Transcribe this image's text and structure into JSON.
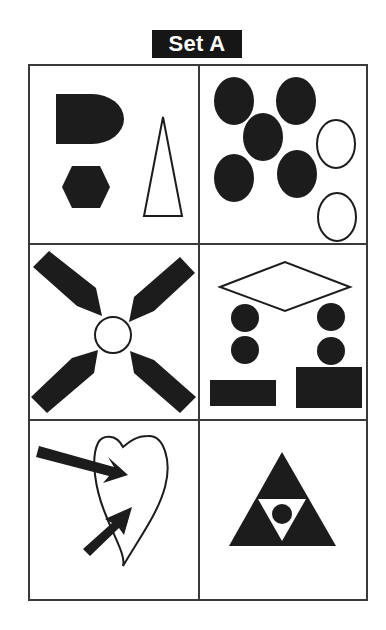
{
  "title": "Set A",
  "colors": {
    "ink": "#1c1c1c",
    "border": "#3a3a3a",
    "background": "#ffffff",
    "title_bg": "#161616",
    "title_text": "#ffffff"
  },
  "grid": {
    "rows": 3,
    "columns": 2,
    "cells": [
      {
        "position": "row1-col1",
        "shapes": [
          "filled D-shape (rounded right half)",
          "filled hexagon",
          "outlined tall narrow triangle"
        ]
      },
      {
        "position": "row1-col2",
        "shapes": [
          "5 filled ovals",
          "2 outlined ovals"
        ]
      },
      {
        "position": "row2-col1",
        "shapes": [
          "4 filled pointed bars in X arrangement",
          "outlined center circle"
        ]
      },
      {
        "position": "row2-col2",
        "shapes": [
          "outlined diamond",
          "4 filled circles",
          "2 filled rectangles"
        ]
      },
      {
        "position": "row3-col1",
        "shapes": [
          "outlined heart",
          "2 filled arrows pointing into heart"
        ]
      },
      {
        "position": "row3-col2",
        "shapes": [
          "filled triangle",
          "inner white inverted triangle",
          "filled center circle"
        ]
      }
    ]
  }
}
